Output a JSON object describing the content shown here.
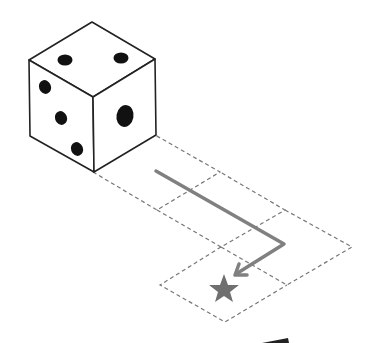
{
  "diagram": {
    "type": "dice-rolling-puzzle",
    "die": {
      "top_face_pips": 2,
      "left_face_pips": 3,
      "right_face_pips": 1
    },
    "grid": {
      "cells": 5,
      "style": "dashed"
    },
    "path": {
      "moves": [
        "forward",
        "forward",
        "turn-right",
        "forward"
      ],
      "color": "#7a7a7a"
    },
    "target": {
      "icon": "star-icon",
      "color": "#707070"
    }
  }
}
